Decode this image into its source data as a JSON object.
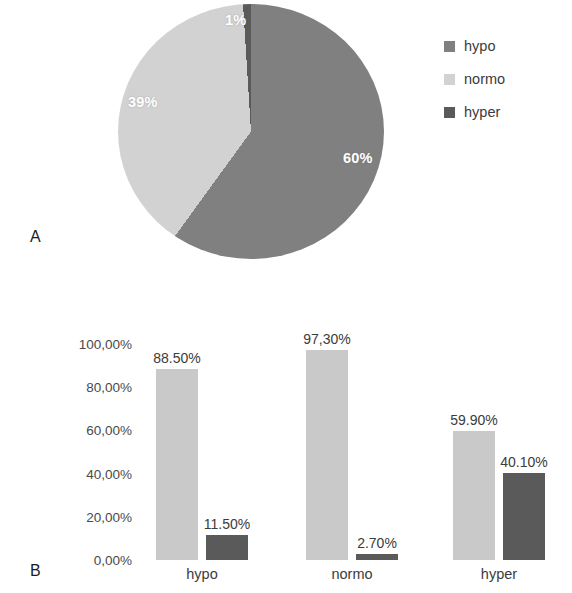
{
  "figure": {
    "panel_a_letter": "A",
    "panel_b_letter": "B"
  },
  "colors": {
    "hypo": "#808080",
    "normo": "#d2d2d2",
    "hyper": "#5a5a5a",
    "bar_light": "#c9c9c9",
    "bar_dark": "#5a5a5a",
    "label_text": "#3b3b3b",
    "pie_label_text": "#ffffff"
  },
  "legend": {
    "items": [
      {
        "label": "hypo",
        "swatch_icon": "square-swatch-icon",
        "color": "#808080"
      },
      {
        "label": "normo",
        "swatch_icon": "square-swatch-icon",
        "color": "#d2d2d2"
      },
      {
        "label": "hyper",
        "swatch_icon": "square-swatch-icon",
        "color": "#5a5a5a"
      }
    ]
  },
  "chart_data": [
    {
      "type": "pie",
      "title": "",
      "labels": [
        "hypo",
        "normo",
        "hyper"
      ],
      "values": [
        60,
        39,
        1
      ],
      "value_labels": [
        "60%",
        "39%",
        "1%"
      ],
      "colors": [
        "#808080",
        "#d2d2d2",
        "#5a5a5a"
      ],
      "legend_position": "right",
      "start_angle_deg": 0,
      "direction": "clockwise"
    },
    {
      "type": "bar",
      "title": "",
      "xlabel": "",
      "ylabel": "",
      "categories": [
        "hypo",
        "normo",
        "hyper"
      ],
      "ylim": [
        0,
        100
      ],
      "yticks": [
        0,
        20,
        40,
        60,
        80,
        100
      ],
      "ytick_labels": [
        "0,00%",
        "20,00%",
        "40,00%",
        "60,00%",
        "80,00%",
        "100,00%"
      ],
      "grid": false,
      "legend_position": "none",
      "series": [
        {
          "name": "normo",
          "color": "#c9c9c9",
          "values": [
            88.5,
            97.3,
            59.9
          ],
          "value_labels": [
            "88.50%",
            "97,30%",
            "59.90%"
          ]
        },
        {
          "name": "hyper",
          "color": "#5a5a5a",
          "values": [
            11.5,
            2.7,
            40.1
          ],
          "value_labels": [
            "11.50%",
            "2.70%",
            "40.10%"
          ]
        }
      ]
    }
  ]
}
